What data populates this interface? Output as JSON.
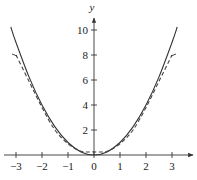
{
  "chart_data": {
    "type": "line",
    "title": "",
    "xlabel": "",
    "ylabel": "y",
    "xlim": [
      -3.35,
      3.6
    ],
    "ylim": [
      0,
      11
    ],
    "x_ticks": [
      -3,
      -2,
      -1,
      0,
      1,
      2,
      3
    ],
    "x_tick_labels": [
      "−3",
      "−2",
      "−1",
      "0",
      "1",
      "2",
      "3"
    ],
    "y_ticks": [
      2,
      4,
      6,
      8,
      10
    ],
    "y_tick_labels": [
      "2",
      "4",
      "6",
      "8",
      "10"
    ],
    "grid": false,
    "legend": null,
    "series": [
      {
        "name": "f(x) = x^2",
        "style": "solid",
        "x": [
          -3.2,
          -3,
          -2.5,
          -2,
          -1.5,
          -1,
          -0.5,
          0,
          0.5,
          1,
          1.5,
          2,
          2.5,
          3,
          3.2
        ],
        "y": [
          10.24,
          9,
          6.25,
          4,
          2.25,
          1,
          0.25,
          0,
          0.25,
          1,
          2.25,
          4,
          6.25,
          9,
          10.24
        ]
      },
      {
        "name": "approximation",
        "style": "dashed",
        "x": [
          -3,
          -2.5,
          -2,
          -1.5,
          -1,
          -0.5,
          0,
          0.5,
          1,
          1.5,
          2,
          2.5,
          3
        ],
        "y": [
          8.0,
          5.9,
          3.8,
          2.0,
          0.9,
          0.3,
          0.25,
          0.3,
          0.9,
          2.0,
          3.8,
          5.9,
          8.0
        ]
      }
    ]
  }
}
